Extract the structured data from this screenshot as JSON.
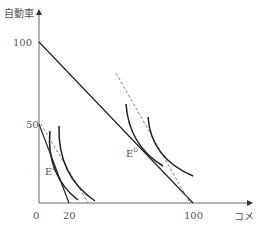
{
  "diagram": {
    "type": "indifference-curve-budget-line",
    "y_axis_label": "自動車",
    "x_axis_label": "コメ",
    "origin_label": "0",
    "y_ticks": [
      {
        "label": "100",
        "value": 100
      },
      {
        "label": "50",
        "value": 50
      }
    ],
    "x_ticks": [
      {
        "label": "20",
        "value": 20
      },
      {
        "label": "100",
        "value": 100
      }
    ],
    "points": [
      {
        "label": "E",
        "sup": "I"
      },
      {
        "label": "E",
        "sup": "D"
      }
    ],
    "lines": [
      {
        "name": "budget-line-small",
        "from": [
          0,
          50
        ],
        "to": [
          20,
          0
        ],
        "style": "solid"
      },
      {
        "name": "budget-line-large",
        "from": [
          0,
          100
        ],
        "to": [
          100,
          0
        ],
        "style": "solid"
      },
      {
        "name": "price-line-left",
        "style": "dashed"
      },
      {
        "name": "price-line-right",
        "style": "dashed"
      }
    ],
    "colors": {
      "line": "#222222",
      "axis": "#666666",
      "dashed": "#777777",
      "text": "#555555"
    }
  }
}
